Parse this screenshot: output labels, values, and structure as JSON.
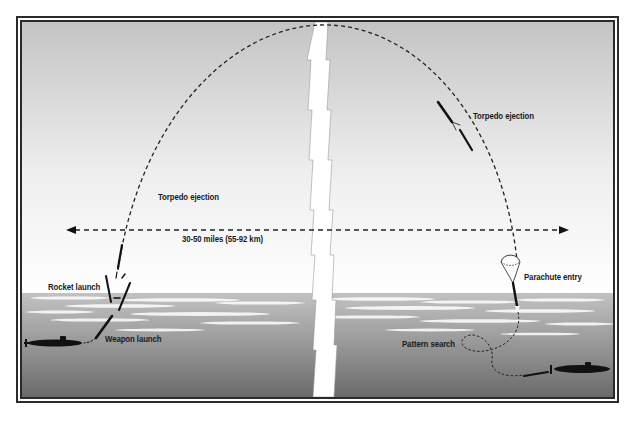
{
  "diagram": {
    "type": "process-illustration",
    "colors": {
      "sky_top": "#c4c4c4",
      "sky_bottom": "#ffffff",
      "water_surface": "#b0b0b0",
      "water_deep": "#6a6a6a",
      "frame": "#2a2a2a",
      "ink": "#111111"
    },
    "labels": {
      "torpedo_ejection_left": "Torpedo ejection",
      "torpedo_ejection_right": "Torpedo ejection",
      "range": "30-50 miles (55-92 km)",
      "rocket_launch": "Rocket launch",
      "weapon_launch": "Weapon launch",
      "parachute_entry": "Parachute entry",
      "pattern_search": "Pattern search"
    },
    "elements": [
      {
        "id": "launching-submarine",
        "icon": "submarine-silhouette",
        "position": "lower-left"
      },
      {
        "id": "target-submarine",
        "icon": "submarine-silhouette",
        "position": "lower-right"
      },
      {
        "id": "flight-arc",
        "style": "dashed",
        "shape": "parabolic arc"
      },
      {
        "id": "range-arrow",
        "style": "dashed double-headed arrow"
      },
      {
        "id": "distance-break",
        "icon": "zigzag-break-band",
        "position": "center"
      },
      {
        "id": "parachute",
        "icon": "parachute"
      },
      {
        "id": "search-loop",
        "style": "dashed loop"
      }
    ]
  }
}
